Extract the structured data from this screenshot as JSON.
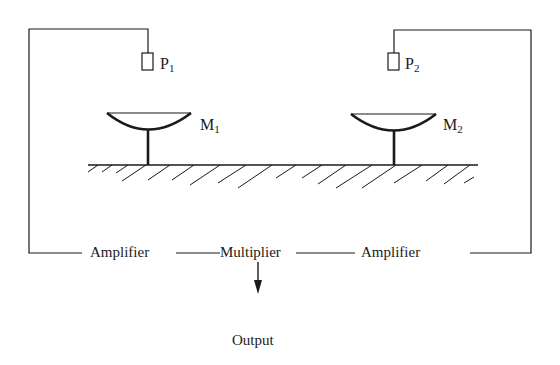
{
  "diagram": {
    "type": "schematic",
    "probes": [
      {
        "id": "P1",
        "label": "P",
        "subscript": "1"
      },
      {
        "id": "P2",
        "label": "P",
        "subscript": "2"
      }
    ],
    "mirrors": [
      {
        "id": "M1",
        "label": "M",
        "subscript": "1"
      },
      {
        "id": "M2",
        "label": "M",
        "subscript": "2"
      }
    ],
    "blocks": {
      "amplifier_left": "Amplifier",
      "multiplier": "Multiplier",
      "amplifier_right": "Amplifier",
      "output": "Output"
    },
    "connections": [
      [
        "P1",
        "amplifier_left"
      ],
      [
        "amplifier_left",
        "multiplier"
      ],
      [
        "P2",
        "amplifier_right"
      ],
      [
        "amplifier_right",
        "multiplier"
      ],
      [
        "multiplier",
        "output"
      ]
    ],
    "colors": {
      "line": "#1a1a1a",
      "background": "#ffffff"
    }
  }
}
